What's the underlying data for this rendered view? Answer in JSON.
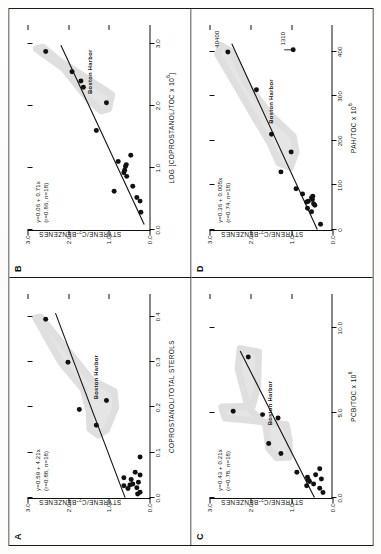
{
  "figure": {
    "y_axis_label": "STYRENE/C2-BENZENES",
    "harbor_label": "Boston Harbor"
  },
  "panels": {
    "A": {
      "letter": "A",
      "xlabel": "COPROSTANOL/TOTAL STEROLS",
      "ylabel": "STYRENE/C2-BENZENES",
      "equation_line1": "y=0.59 + 4.21x",
      "equation_line2": "(r=0.88, n=18)",
      "harbor_label": "Boston Harbor"
    },
    "B": {
      "letter": "B",
      "xlabel": "LOG [COPROSTANOL/TOC x 10^6]",
      "ylabel": "STYRENE/C2-BENZENES",
      "equation_line1": "y=0.06 + 0.71x",
      "equation_line2": "(r=0.86, n=18)",
      "harbor_label": "Boston Harbor"
    },
    "C": {
      "letter": "C",
      "xlabel": "PCB/TOC x 10^6",
      "ylabel": "STYRENE/C2-BENZENES",
      "equation_line1": "y=0.43 + 0.21x",
      "equation_line2": "(r=0.78, n=18)",
      "harbor_label": "Boston Harbor"
    },
    "D": {
      "letter": "D",
      "xlabel": "PAH/TOC x 10^6",
      "ylabel": "STYRENE/C2-BENZENES",
      "equation_line1": "y=0.36 + 0.005x",
      "equation_line2": "(r=0.74, n=18)",
      "harbor_label": "Boston Harbor",
      "annotation_high": "40400",
      "annotation_arrow": "1310"
    }
  },
  "chart_data": [
    {
      "id": "A",
      "type": "scatter",
      "title": "A",
      "xlabel": "COPROSTANOL/TOTAL STEROLS",
      "ylabel": "STYRENE/C2-BENZENES",
      "xlim": [
        0.0,
        0.45
      ],
      "ylim": [
        0.0,
        3.0
      ],
      "xticks": [
        "0.0",
        "0.1",
        "0.2",
        "0.3",
        "0.4"
      ],
      "xtick_values": [
        0.0,
        0.1,
        0.2,
        0.3,
        0.4
      ],
      "yticks": [
        "0.0",
        "1.0",
        "2.0",
        "3.0"
      ],
      "ytick_values": [
        0.0,
        1.0,
        2.0,
        3.0
      ],
      "grid": false,
      "legend": "none",
      "regression": {
        "slope": 4.21,
        "intercept": 0.59,
        "r": 0.88,
        "n": 18
      },
      "points": [
        {
          "x": 0.008,
          "y": 0.28
        },
        {
          "x": 0.012,
          "y": 0.22
        },
        {
          "x": 0.02,
          "y": 0.52
        },
        {
          "x": 0.022,
          "y": 0.3
        },
        {
          "x": 0.026,
          "y": 0.62
        },
        {
          "x": 0.028,
          "y": 0.47
        },
        {
          "x": 0.03,
          "y": 0.4
        },
        {
          "x": 0.034,
          "y": 0.26
        },
        {
          "x": 0.04,
          "y": 0.44
        },
        {
          "x": 0.044,
          "y": 0.62
        },
        {
          "x": 0.05,
          "y": 0.22
        },
        {
          "x": 0.056,
          "y": 0.34
        },
        {
          "x": 0.09,
          "y": 0.22
        },
        {
          "x": 0.16,
          "y": 1.3
        },
        {
          "x": 0.195,
          "y": 1.72
        },
        {
          "x": 0.215,
          "y": 1.05
        },
        {
          "x": 0.3,
          "y": 2.0
        },
        {
          "x": 0.395,
          "y": 2.55
        }
      ],
      "harbor_envelope": [
        [
          0.15,
          1.05
        ],
        [
          0.2,
          0.82
        ],
        [
          0.235,
          0.86
        ],
        [
          0.26,
          1.42
        ],
        [
          0.32,
          1.95
        ],
        [
          0.4,
          2.68
        ],
        [
          0.398,
          2.8
        ],
        [
          0.3,
          2.18
        ],
        [
          0.24,
          1.62
        ],
        [
          0.19,
          1.48
        ],
        [
          0.152,
          1.46
        ],
        [
          0.138,
          1.25
        ]
      ]
    },
    {
      "id": "B",
      "type": "scatter",
      "title": "B",
      "xlabel": "LOG [COPROSTANOL/TOC x 10^6]",
      "ylabel": "STYRENE/C2-BENZENES",
      "xlim": [
        0.0,
        3.3
      ],
      "ylim": [
        0.0,
        3.0
      ],
      "xticks": [
        "0.0",
        "1.0",
        "2.0",
        "3.0"
      ],
      "xtick_values": [
        0.0,
        1.0,
        2.0,
        3.0
      ],
      "yticks": [
        "0.0",
        "1.0",
        "2.0",
        "3.0"
      ],
      "ytick_values": [
        0.0,
        1.0,
        2.0,
        3.0
      ],
      "grid": false,
      "legend": "none",
      "regression": {
        "slope": 0.71,
        "intercept": 0.06,
        "r": 0.86,
        "n": 18
      },
      "points": [
        {
          "x": 0.28,
          "y": 0.2
        },
        {
          "x": 0.46,
          "y": 0.22
        },
        {
          "x": 0.52,
          "y": 0.3
        },
        {
          "x": 0.62,
          "y": 0.86
        },
        {
          "x": 0.7,
          "y": 0.4
        },
        {
          "x": 0.86,
          "y": 0.55
        },
        {
          "x": 0.92,
          "y": 0.62
        },
        {
          "x": 0.96,
          "y": 0.6
        },
        {
          "x": 1.02,
          "y": 0.58
        },
        {
          "x": 1.05,
          "y": 0.56
        },
        {
          "x": 1.1,
          "y": 0.76
        },
        {
          "x": 1.2,
          "y": 0.45
        },
        {
          "x": 1.6,
          "y": 1.3
        },
        {
          "x": 2.05,
          "y": 1.05
        },
        {
          "x": 2.3,
          "y": 1.62
        },
        {
          "x": 2.4,
          "y": 1.68
        },
        {
          "x": 2.55,
          "y": 1.9
        },
        {
          "x": 2.88,
          "y": 2.55
        }
      ],
      "harbor_envelope": [
        [
          1.95,
          1.0
        ],
        [
          2.18,
          0.92
        ],
        [
          2.45,
          1.55
        ],
        [
          2.72,
          2.2
        ],
        [
          2.95,
          2.62
        ],
        [
          2.92,
          2.78
        ],
        [
          2.6,
          2.1
        ],
        [
          2.35,
          1.8
        ],
        [
          2.12,
          1.52
        ],
        [
          1.92,
          1.18
        ]
      ]
    },
    {
      "id": "C",
      "type": "scatter",
      "title": "C",
      "xlabel": "PCB/TOC x 10^6",
      "ylabel": "STYRENE/C2-BENZENES",
      "xlim": [
        0.0,
        12.0
      ],
      "ylim": [
        0.0,
        3.0
      ],
      "xticks": [
        "0.0",
        "5.0",
        "10.0"
      ],
      "xtick_values": [
        0.0,
        5.0,
        10.0
      ],
      "yticks": [
        "0.0",
        "1.0",
        "2.0",
        "3.0"
      ],
      "ytick_values": [
        0.0,
        1.0,
        2.0,
        3.0
      ],
      "grid": false,
      "legend": "none",
      "regression": {
        "slope": 0.21,
        "intercept": 0.43,
        "r": 0.78,
        "n": 18
      },
      "points": [
        {
          "x": 0.3,
          "y": 0.22
        },
        {
          "x": 0.55,
          "y": 0.3
        },
        {
          "x": 0.7,
          "y": 0.62
        },
        {
          "x": 0.8,
          "y": 0.45
        },
        {
          "x": 0.95,
          "y": 0.55
        },
        {
          "x": 1.05,
          "y": 0.58
        },
        {
          "x": 1.1,
          "y": 0.26
        },
        {
          "x": 1.2,
          "y": 0.6
        },
        {
          "x": 1.35,
          "y": 0.4
        },
        {
          "x": 1.5,
          "y": 0.86
        },
        {
          "x": 1.7,
          "y": 0.3
        },
        {
          "x": 2.6,
          "y": 1.25
        },
        {
          "x": 3.2,
          "y": 1.55
        },
        {
          "x": 4.7,
          "y": 1.32
        },
        {
          "x": 4.9,
          "y": 1.7
        },
        {
          "x": 5.1,
          "y": 2.42
        },
        {
          "x": 8.3,
          "y": 2.05
        }
      ],
      "harbor_envelope": [
        [
          2.4,
          1.05
        ],
        [
          3.4,
          1.05
        ],
        [
          4.3,
          1.12
        ],
        [
          4.55,
          1.95
        ],
        [
          4.7,
          2.62
        ],
        [
          5.35,
          2.7
        ],
        [
          5.4,
          1.95
        ],
        [
          6.6,
          1.82
        ],
        [
          8.6,
          1.8
        ],
        [
          8.8,
          2.25
        ],
        [
          7.6,
          2.3
        ],
        [
          5.3,
          2.05
        ],
        [
          4.3,
          1.62
        ],
        [
          2.9,
          1.55
        ],
        [
          2.35,
          1.35
        ]
      ]
    },
    {
      "id": "D",
      "type": "scatter",
      "title": "D",
      "xlabel": "PAH/TOC x 10^6",
      "ylabel": "STYRENE/C2-BENZENES",
      "xlim": [
        0.0,
        460.0
      ],
      "ylim": [
        0.0,
        3.0
      ],
      "xticks": [
        "0",
        "100",
        "200",
        "300",
        "400"
      ],
      "xtick_values": [
        0,
        100,
        200,
        300,
        400
      ],
      "yticks": [
        "0.0",
        "1.0",
        "2.0",
        "3.0"
      ],
      "ytick_values": [
        0.0,
        1.0,
        2.0,
        3.0
      ],
      "grid": false,
      "legend": "none",
      "regression": {
        "slope": 0.005,
        "intercept": 0.36,
        "r": 0.74,
        "n": 18
      },
      "points": [
        {
          "x": 12,
          "y": 0.28
        },
        {
          "x": 40,
          "y": 0.5
        },
        {
          "x": 48,
          "y": 0.6
        },
        {
          "x": 55,
          "y": 0.42
        },
        {
          "x": 58,
          "y": 0.45
        },
        {
          "x": 62,
          "y": 0.62
        },
        {
          "x": 64,
          "y": 0.58
        },
        {
          "x": 68,
          "y": 0.48
        },
        {
          "x": 72,
          "y": 0.5
        },
        {
          "x": 75,
          "y": 0.47
        },
        {
          "x": 80,
          "y": 0.72
        },
        {
          "x": 92,
          "y": 0.88
        },
        {
          "x": 130,
          "y": 1.25
        },
        {
          "x": 175,
          "y": 1.0
        },
        {
          "x": 215,
          "y": 1.48
        },
        {
          "x": 315,
          "y": 1.85
        },
        {
          "x": 400,
          "y": 2.55
        },
        {
          "x": 405,
          "y": 0.95
        }
      ],
      "harbor_envelope": [
        [
          140,
          1.02
        ],
        [
          175,
          0.88
        ],
        [
          210,
          0.95
        ],
        [
          260,
          1.52
        ],
        [
          330,
          2.1
        ],
        [
          400,
          2.45
        ],
        [
          415,
          2.72
        ],
        [
          395,
          2.8
        ],
        [
          320,
          2.32
        ],
        [
          250,
          1.88
        ],
        [
          195,
          1.52
        ],
        [
          150,
          1.3
        ]
      ],
      "annotations": [
        {
          "text": "40400",
          "x": 400,
          "y": 2.55,
          "note": "off-scale high value label"
        },
        {
          "text": "1310",
          "x": 405,
          "y": 0.95,
          "note": "arrow annotation"
        }
      ]
    }
  ]
}
